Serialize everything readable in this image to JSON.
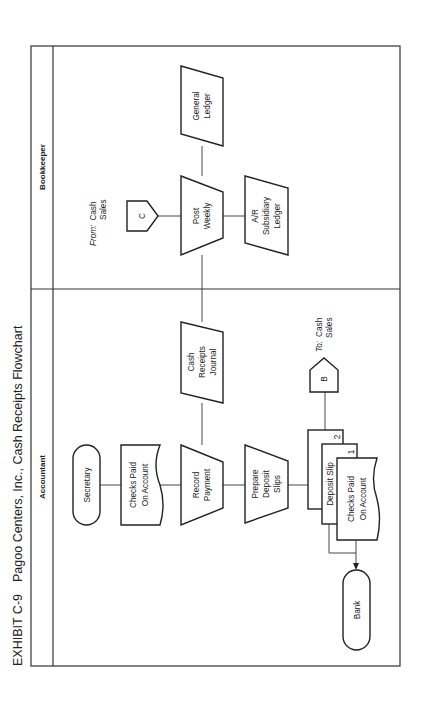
{
  "title": {
    "exhibit": "EXHIBIT C-9",
    "text": "Pagoo Centers, Inc., Cash Receipts Flowchart"
  },
  "lanes": [
    {
      "id": "accountant",
      "label": "Accountant"
    },
    {
      "id": "bookkeeper",
      "label": "Bookkeeper"
    }
  ],
  "nodes": {
    "secretary": {
      "type": "terminal",
      "lines": [
        "Secretary"
      ]
    },
    "checks_paid_1": {
      "type": "document",
      "lines": [
        "Checks Paid",
        "On Account"
      ]
    },
    "record_payment": {
      "type": "manual-operation",
      "lines": [
        "Record",
        "Payment"
      ]
    },
    "prepare_deposit_slips": {
      "type": "manual-operation",
      "lines": [
        "Prepare",
        "Deposit",
        "Slips"
      ]
    },
    "deposit_slip_2": {
      "type": "document",
      "copy": "2"
    },
    "deposit_slip_1": {
      "type": "document",
      "lines": [
        "Deposit Slip"
      ],
      "copy": "1"
    },
    "checks_paid_2": {
      "type": "document",
      "lines": [
        "Checks Paid",
        "On Account"
      ]
    },
    "bank": {
      "type": "terminal",
      "lines": [
        "Bank"
      ]
    },
    "cash_receipts_journal": {
      "type": "journal",
      "lines": [
        "Cash",
        "Receipts",
        "Journal"
      ]
    },
    "connector_b": {
      "type": "off-page-connector",
      "letter": "B",
      "note_prefix": "To:",
      "note_lines": [
        "Cash",
        "Sales"
      ]
    },
    "connector_c": {
      "type": "off-page-connector",
      "letter": "C",
      "note_prefix": "From:",
      "note_lines": [
        "Cash",
        "Sales"
      ]
    },
    "post_weekly": {
      "type": "manual-operation",
      "lines": [
        "Post",
        "Weekly"
      ]
    },
    "ar_subsidiary_ledger": {
      "type": "journal",
      "lines": [
        "A/R",
        "Subsidiary",
        "Ledger"
      ]
    },
    "general_ledger": {
      "type": "journal",
      "lines": [
        "General",
        "Ledger"
      ]
    }
  }
}
